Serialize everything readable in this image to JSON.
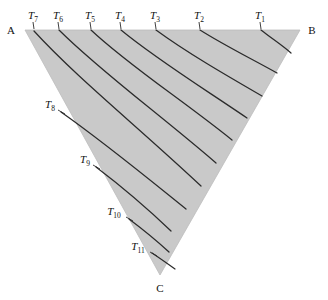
{
  "figure": {
    "kind": "ternary-isotherm-diagram",
    "background_color": "#ffffff",
    "field_fill_color": "#c9c9c9",
    "field_edge_color": "#bdbdbd",
    "curve_color": "#2b2b2b",
    "text_color": "#111111"
  },
  "vertices": [
    {
      "id": "A",
      "label": "A",
      "x": 25,
      "y": 30,
      "label_x": 11,
      "label_y": 34,
      "anchor": "middle"
    },
    {
      "id": "B",
      "label": "B",
      "x": 300,
      "y": 30,
      "label_x": 312,
      "label_y": 34,
      "anchor": "middle"
    },
    {
      "id": "C",
      "label": "C",
      "x": 160,
      "y": 275,
      "label_x": 160,
      "label_y": 292,
      "anchor": "middle"
    }
  ],
  "isotherms": [
    {
      "id": "T1",
      "symbol": "T",
      "subscript": "1",
      "label_x": 260,
      "label_y": 19,
      "anchor": "middle",
      "tick": {
        "x1": 260,
        "y1": 22,
        "x2": 261,
        "y2": 29
      },
      "path": "M 261 30 C 271 38 282 45 291 53"
    },
    {
      "id": "T2",
      "symbol": "T",
      "subscript": "2",
      "label_x": 199,
      "label_y": 19,
      "anchor": "middle",
      "tick": {
        "x1": 199,
        "y1": 22,
        "x2": 200,
        "y2": 29
      },
      "path": "M 200 30 C 222 44 248 57 277 73"
    },
    {
      "id": "T3",
      "symbol": "T",
      "subscript": "3",
      "label_x": 155,
      "label_y": 19,
      "anchor": "middle",
      "tick": {
        "x1": 155,
        "y1": 22,
        "x2": 156,
        "y2": 29
      },
      "path": "M 156 30 C 186 52 224 74 262 96"
    },
    {
      "id": "T4",
      "symbol": "T",
      "subscript": "4",
      "label_x": 120,
      "label_y": 19,
      "anchor": "middle",
      "tick": {
        "x1": 120,
        "y1": 22,
        "x2": 121,
        "y2": 29
      },
      "path": "M 121 30 C 156 59 203 88 247 118"
    },
    {
      "id": "T5",
      "symbol": "T",
      "subscript": "5",
      "label_x": 90,
      "label_y": 19,
      "anchor": "middle",
      "tick": {
        "x1": 90,
        "y1": 22,
        "x2": 91,
        "y2": 29
      },
      "path": "M 91 30 C 128 65 181 99 232 140"
    },
    {
      "id": "T6",
      "symbol": "T",
      "subscript": "6",
      "label_x": 58,
      "label_y": 19,
      "anchor": "middle",
      "tick": {
        "x1": 58,
        "y1": 22,
        "x2": 59,
        "y2": 29
      },
      "path": "M 59 30 C 100 71 158 113 216 163"
    },
    {
      "id": "T7",
      "symbol": "T",
      "subscript": "7",
      "label_x": 33,
      "label_y": 19,
      "anchor": "middle",
      "tick": {
        "x1": 33,
        "y1": 22,
        "x2": 34,
        "y2": 29
      },
      "path": "M 34 31 C 76 77 137 126 201 186"
    },
    {
      "id": "T8",
      "symbol": "T",
      "subscript": "8",
      "label_x": 50,
      "label_y": 108,
      "anchor": "middle",
      "tick": {
        "x1": 58,
        "y1": 110,
        "x2": 65,
        "y2": 114
      },
      "path": "M 61 112 C 105 143 145 176 186 209"
    },
    {
      "id": "T9",
      "symbol": "T",
      "subscript": "9",
      "label_x": 85,
      "label_y": 163,
      "anchor": "middle",
      "tick": {
        "x1": 93,
        "y1": 165,
        "x2": 100,
        "y2": 169
      },
      "path": "M 96 167 C 125 189 147 208 171 231"
    },
    {
      "id": "T10",
      "symbol": "T",
      "subscript": "10",
      "label_x": 114,
      "label_y": 215,
      "anchor": "middle",
      "tick": {
        "x1": 126,
        "y1": 217,
        "x2": 133,
        "y2": 221
      },
      "path": "M 129 219 C 145 231 157 241 169 252"
    },
    {
      "id": "T11",
      "symbol": "T",
      "subscript": "11",
      "label_x": 138,
      "label_y": 250,
      "anchor": "middle",
      "tick": {
        "x1": 150,
        "y1": 252,
        "x2": 157,
        "y2": 256
      },
      "path": "M 152 253 C 161 259 168 264 175 269"
    }
  ]
}
